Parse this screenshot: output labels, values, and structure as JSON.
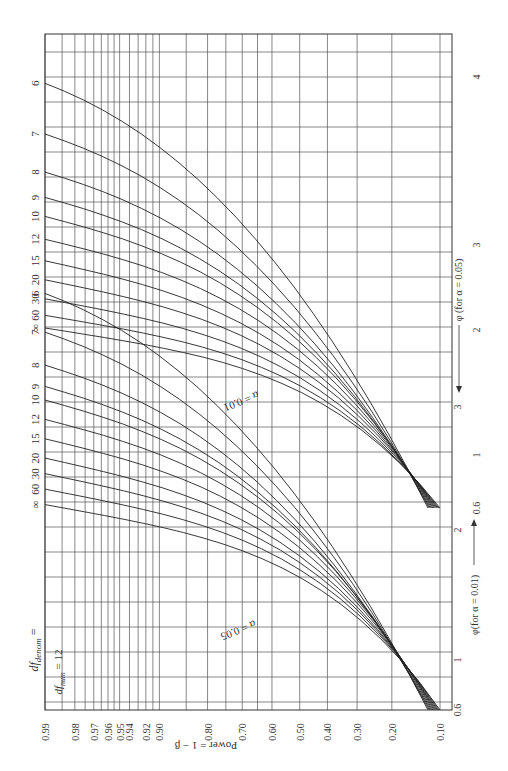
{
  "chart_data": {
    "type": "line",
    "orientation": "rotated-90",
    "df_num_label": "df_num = 12",
    "df_denom_label": "df_denom =",
    "xlabel": "Power = 1 - β",
    "ylabel_alpha_01": "φ(for α = 0.01)",
    "ylabel_alpha_05": "φ (for α = 0.05)",
    "power_ticks": [
      "0.99",
      "0.98",
      "0.97",
      "0.96",
      "0.95",
      "0.94",
      "0.92",
      "0.90",
      "0.80",
      "0.70",
      "0.60",
      "0.50",
      "0.40",
      "0.30",
      "0.20",
      "0.10"
    ],
    "phi_ticks_alpha_01": [
      "0.6",
      "1",
      "2",
      "3"
    ],
    "phi_ticks_alpha_05": [
      "0.6",
      "1",
      "2",
      "3",
      "4"
    ],
    "series_groups": [
      {
        "name": "α = 0.05",
        "df_denom_labels": [
          "6",
          "7",
          "8",
          "9",
          "10",
          "12",
          "15",
          "20",
          "30",
          "60",
          "∞"
        ],
        "phi_at_power_099": [
          3.95,
          3.55,
          3.25,
          3.05,
          2.9,
          2.72,
          2.55,
          2.4,
          2.25,
          2.12,
          2.02
        ]
      },
      {
        "name": "α = 0.01",
        "df_denom_labels": [
          "6",
          "7",
          "8",
          "9",
          "10",
          "12",
          "15",
          "20",
          "30",
          "60",
          "∞"
        ],
        "phi_at_power_099": [
          2.75,
          2.55,
          2.38,
          2.27,
          2.2,
          2.1,
          2.0,
          1.9,
          1.82,
          1.74,
          1.66
        ]
      }
    ],
    "annotations": [
      "α = 0.05",
      "α = 0.01"
    ],
    "grid": true
  },
  "labels": {
    "df_num": "df",
    "df_num_sub": "num",
    "df_num_eq": "= 12",
    "df_denom": "df",
    "df_denom_sub": "denom",
    "df_denom_eq": "=",
    "power_axis": "Power = 1 − β",
    "phi01": "φ(for α = 0.01)",
    "phi05": "φ (for α = 0.05)",
    "alpha05": "α = 0.05",
    "alpha01": "α = 0.01"
  }
}
